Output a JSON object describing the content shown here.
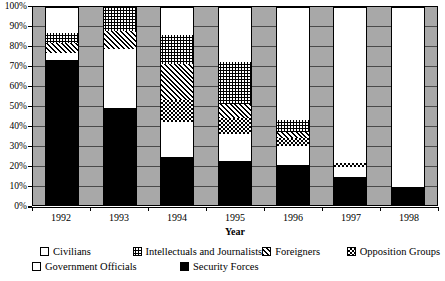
{
  "chart_data": {
    "type": "bar",
    "subtype": "stacked-percentage",
    "title": "",
    "xlabel": "Year",
    "ylabel": "",
    "ylim": [
      0,
      100
    ],
    "ytick_labels": [
      "100%",
      "90%",
      "80%",
      "70%",
      "60%",
      "50%",
      "40%",
      "30%",
      "20%",
      "10%",
      "0%"
    ],
    "ytick_values": [
      100,
      90,
      80,
      70,
      60,
      50,
      40,
      30,
      20,
      10,
      0
    ],
    "grid": true,
    "legend_position": "bottom",
    "categories": [
      "1992",
      "1993",
      "1994",
      "1995",
      "1996",
      "1997",
      "1998"
    ],
    "series": [
      {
        "name": "Civilians",
        "pattern": "solid-white",
        "values": [
          13,
          0,
          14,
          28,
          57,
          79,
          91
        ]
      },
      {
        "name": "Intellectuals and Journalists",
        "pattern": "fine-crosshatch",
        "values": [
          5,
          12,
          15,
          21,
          6,
          0,
          0
        ]
      },
      {
        "name": "Foreigners",
        "pattern": "diagonal-hatch",
        "values": [
          5,
          9,
          18,
          7,
          3,
          0,
          0
        ]
      },
      {
        "name": "Opposition Groups",
        "pattern": "checkerboard",
        "values": [
          0,
          0,
          11,
          8,
          4,
          2,
          0
        ]
      },
      {
        "name": "Government Officials",
        "pattern": "sparse-dots",
        "values": [
          4,
          30,
          18,
          14,
          10,
          5,
          0
        ]
      },
      {
        "name": "Security Forces",
        "pattern": "solid-black",
        "values": [
          73,
          49,
          24,
          22,
          20,
          14,
          9
        ]
      }
    ]
  },
  "axis": {
    "x_title": "Year"
  },
  "legend": {
    "items": [
      {
        "label": "Civilians",
        "swatch": "swatch-civilians"
      },
      {
        "label": "Intellectuals and Journalists",
        "swatch": "swatch-intellectuals"
      },
      {
        "label": "Foreigners",
        "swatch": "swatch-foreigners"
      },
      {
        "label": "Opposition Groups",
        "swatch": "swatch-opposition"
      },
      {
        "label": "Government Officials",
        "swatch": "swatch-government"
      },
      {
        "label": "Security Forces",
        "swatch": "swatch-security"
      }
    ]
  }
}
